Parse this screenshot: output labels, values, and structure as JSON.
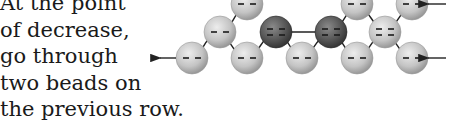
{
  "caption": {
    "lines": [
      "At the point",
      "of decrease,",
      "go through",
      "two beads on",
      "the previous row."
    ]
  },
  "diagram": {
    "bead_radius": 16,
    "colors": {
      "light_bead": "#c8c8c8",
      "dark_bead": "#5a5a5a",
      "thread": "#222222"
    },
    "beads": [
      {
        "row": "top",
        "x": 247,
        "y": 4,
        "shade": "light"
      },
      {
        "row": "top",
        "x": 357,
        "y": 4,
        "shade": "light"
      },
      {
        "row": "top",
        "x": 412,
        "y": 4,
        "shade": "light"
      },
      {
        "row": "middle",
        "x": 220,
        "y": 32,
        "shade": "light"
      },
      {
        "row": "middle",
        "x": 276,
        "y": 32,
        "shade": "dark"
      },
      {
        "row": "middle",
        "x": 331,
        "y": 32,
        "shade": "dark"
      },
      {
        "row": "middle",
        "x": 385,
        "y": 32,
        "shade": "light"
      },
      {
        "row": "bottom",
        "x": 192,
        "y": 58,
        "shade": "light"
      },
      {
        "row": "bottom",
        "x": 247,
        "y": 58,
        "shade": "light"
      },
      {
        "row": "bottom",
        "x": 302,
        "y": 58,
        "shade": "light"
      },
      {
        "row": "bottom",
        "x": 357,
        "y": 58,
        "shade": "light"
      },
      {
        "row": "bottom",
        "x": 412,
        "y": 58,
        "shade": "light"
      }
    ],
    "arrows": [
      {
        "name": "left-exit-arrow",
        "x1": 176,
        "y1": 58,
        "x2": 160,
        "y2": 58
      },
      {
        "name": "top-right-entry-arrow",
        "x1": 446,
        "y1": 4,
        "x2": 428,
        "y2": 4
      },
      {
        "name": "bottom-right-entry-arrow",
        "x1": 446,
        "y1": 58,
        "x2": 428,
        "y2": 58
      }
    ]
  }
}
